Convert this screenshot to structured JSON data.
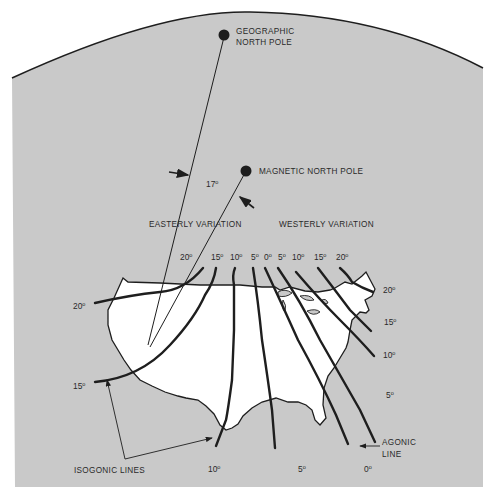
{
  "diagram": {
    "colors": {
      "background": "#ffffff",
      "panel": "#c9c9c9",
      "land": "#ffffff",
      "ink": "#1e1e1e",
      "text": "#2a2a2a"
    },
    "poles": {
      "geographic": {
        "line1": "GEOGRAPHIC",
        "line2": "NORTH POLE"
      },
      "magnetic": {
        "label": "MAGNETIC NORTH POLE"
      },
      "angle": {
        "value": "17",
        "unit": "o"
      }
    },
    "regions": {
      "easterly": "EASTERLY VARIATION",
      "westerly": "WESTERLY VARIATION"
    },
    "top_scale": [
      {
        "value": "20",
        "unit": "o"
      },
      {
        "value": "15",
        "unit": "o"
      },
      {
        "value": "10",
        "unit": "o"
      },
      {
        "value": "5",
        "unit": "o"
      },
      {
        "value": "0",
        "unit": "o"
      },
      {
        "value": "5",
        "unit": "o"
      },
      {
        "value": "10",
        "unit": "o"
      },
      {
        "value": "15",
        "unit": "o"
      },
      {
        "value": "20",
        "unit": "o"
      }
    ],
    "left_scale": [
      {
        "value": "20",
        "unit": "o"
      },
      {
        "value": "15",
        "unit": "o"
      }
    ],
    "right_scale": [
      {
        "value": "20",
        "unit": "o"
      },
      {
        "value": "15",
        "unit": "o"
      },
      {
        "value": "10",
        "unit": "o"
      },
      {
        "value": "5",
        "unit": "o"
      }
    ],
    "bottom_scale": [
      {
        "value": "10",
        "unit": "o"
      },
      {
        "value": "5",
        "unit": "o"
      },
      {
        "value": "0",
        "unit": "o"
      }
    ],
    "callouts": {
      "isogonic": "ISOGONIC LINES",
      "agonic_line1": "AGONIC",
      "agonic_line2": "LINE"
    }
  }
}
